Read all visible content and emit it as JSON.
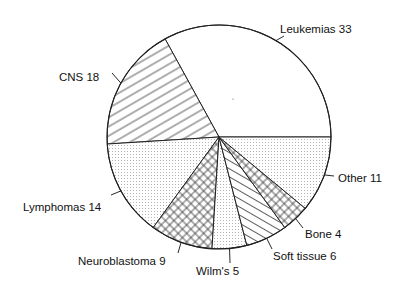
{
  "chart_data": {
    "type": "pie",
    "title": "",
    "start": "right-horizontal, counterclockwise",
    "slices": [
      {
        "label": "Leukemias",
        "value": 33,
        "pattern": "blank"
      },
      {
        "label": "CNS",
        "value": 18,
        "pattern": "diagonal-up"
      },
      {
        "label": "Lymphomas",
        "value": 14,
        "pattern": "dots"
      },
      {
        "label": "Neuroblastoma",
        "value": 9,
        "pattern": "crosshatch"
      },
      {
        "label": "Wilm's",
        "value": 5,
        "pattern": "dots"
      },
      {
        "label": "Soft tissue",
        "value": 6,
        "pattern": "diagonal-down"
      },
      {
        "label": "Bone",
        "value": 4,
        "pattern": "crosshatch"
      },
      {
        "label": "Other",
        "value": 11,
        "pattern": "dots"
      }
    ],
    "labels_text": [
      "Leukemias  33",
      "CNS  18",
      "Lymphomas  14",
      "Neuroblastoma  9",
      "Wilm's  5",
      "Soft tissue  6",
      "Bone  4",
      "Other  11"
    ]
  }
}
